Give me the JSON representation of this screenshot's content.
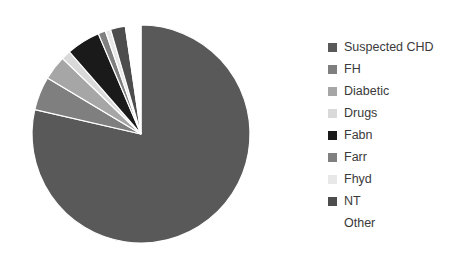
{
  "chart_data": {
    "type": "pie",
    "title": "",
    "subtitle": "",
    "xlabel": "",
    "ylabel": "",
    "grid": false,
    "legend_position": "right",
    "start_angle_deg": 0,
    "direction": "clockwise",
    "categories": [
      "Suspected CHD",
      "FH",
      "Diabetic",
      "Drugs",
      "Fabn",
      "Farr",
      "Fhyd",
      "NT",
      "Other"
    ],
    "values": [
      78.6,
      5.0,
      3.6,
      1.4,
      5.0,
      1.1,
      0.8,
      2.2,
      2.3
    ],
    "units": "percent",
    "colors": [
      "#595959",
      "#7f7f7f",
      "#a6a6a6",
      "#d9d9d9",
      "#1a1a1a",
      "#808080",
      "#e8e8e8",
      "#4d4d4d",
      "#ffffff"
    ],
    "labels": [
      {
        "name": "Suspected CHD",
        "value": 78.6,
        "color": "#595959"
      },
      {
        "name": "FH",
        "value": 5.0,
        "color": "#7f7f7f"
      },
      {
        "name": "Diabetic",
        "value": 3.6,
        "color": "#a6a6a6"
      },
      {
        "name": "Drugs",
        "value": 1.4,
        "color": "#d9d9d9"
      },
      {
        "name": "Fabn",
        "value": 5.0,
        "color": "#1a1a1a"
      },
      {
        "name": "Farr",
        "value": 1.1,
        "color": "#808080"
      },
      {
        "name": "Fhyd",
        "value": 0.8,
        "color": "#e8e8e8"
      },
      {
        "name": "NT",
        "value": 2.2,
        "color": "#4d4d4d"
      },
      {
        "name": "Other",
        "value": 2.3,
        "color": "#ffffff"
      }
    ]
  },
  "legend": {
    "items": [
      {
        "label": "Suspected CHD",
        "color": "#595959"
      },
      {
        "label": "FH",
        "color": "#7f7f7f"
      },
      {
        "label": "Diabetic",
        "color": "#a6a6a6"
      },
      {
        "label": "Drugs",
        "color": "#d9d9d9"
      },
      {
        "label": "Fabn",
        "color": "#1a1a1a"
      },
      {
        "label": "Farr",
        "color": "#808080"
      },
      {
        "label": "Fhyd",
        "color": "#e8e8e8"
      },
      {
        "label": "NT",
        "color": "#4d4d4d"
      },
      {
        "label": "Other",
        "color": "#ffffff"
      }
    ]
  },
  "canvas": {
    "background": "#ffffff",
    "pie_center_x": 123,
    "pie_center_y": 120,
    "pie_radius": 109,
    "slice_gap_color": "#ffffff",
    "slice_gap_width": 1.2
  }
}
